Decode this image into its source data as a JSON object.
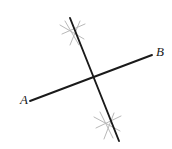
{
  "figure": {
    "kind": "geometry-diagram",
    "canvas": {
      "width": 172,
      "height": 149,
      "background": "#ffffff"
    },
    "colors": {
      "line": "#1a1a1a",
      "tick": "#b9b9b9",
      "label": "#1a1a1a",
      "background": "#ffffff"
    },
    "lines": [
      {
        "id": "line-ab",
        "name": "line-ab",
        "stroke": "#1a1a1a",
        "stroke_width": 1.9,
        "x1": 30,
        "y1": 101,
        "x2": 152,
        "y2": 55
      },
      {
        "id": "line-transversal",
        "name": "transversal-line",
        "stroke": "#1a1a1a",
        "stroke_width": 1.9,
        "x1": 70,
        "y1": 18,
        "x2": 119,
        "y2": 141
      }
    ],
    "intersection": {
      "x": 93,
      "y": 78
    },
    "labels": [
      {
        "id": "label-a",
        "text": "A",
        "x": 20,
        "y": 93
      },
      {
        "id": "label-b",
        "text": "B",
        "x": 156,
        "y": 45
      }
    ],
    "tick_groups": [
      {
        "id": "tick-group-upper",
        "name": "upper-tick-marks",
        "stroke": "#b9b9b9",
        "stroke_width": 1.0,
        "strokes": [
          {
            "x1": 60,
            "y1": 25,
            "x2": 84,
            "y2": 39
          },
          {
            "x1": 62,
            "y1": 34,
            "x2": 85,
            "y2": 24
          },
          {
            "x1": 65,
            "y1": 21,
            "x2": 79,
            "y2": 45
          },
          {
            "x1": 70,
            "y1": 45,
            "x2": 80,
            "y2": 21
          }
        ]
      },
      {
        "id": "tick-group-lower",
        "name": "lower-tick-marks",
        "stroke": "#b9b9b9",
        "stroke_width": 1.0,
        "strokes": [
          {
            "x1": 94,
            "y1": 117,
            "x2": 120,
            "y2": 131
          },
          {
            "x1": 96,
            "y1": 128,
            "x2": 121,
            "y2": 116
          },
          {
            "x1": 100,
            "y1": 112,
            "x2": 113,
            "y2": 138
          },
          {
            "x1": 104,
            "y1": 139,
            "x2": 114,
            "y2": 113
          }
        ]
      }
    ]
  }
}
